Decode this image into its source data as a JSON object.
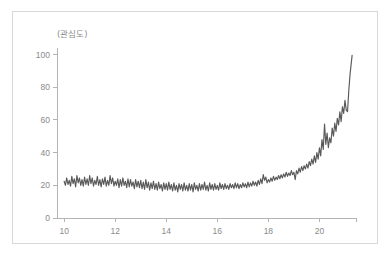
{
  "chart_data": {
    "type": "line",
    "title": "",
    "subtitle": "",
    "xlabel": "",
    "ylabel": "(관심도)",
    "ylabel_position": "top-left-above-axis",
    "xlim": [
      9.72,
      21.55
    ],
    "ylim": [
      0,
      104
    ],
    "grid": false,
    "legend": null,
    "annotations": [],
    "axis": {
      "y_ticks": [
        0,
        20,
        40,
        60,
        80,
        100
      ],
      "y_tick_labels": [
        "0",
        "20",
        "40",
        "60",
        "80",
        "100"
      ],
      "x_ticks": [
        10,
        12,
        14,
        16,
        18,
        20
      ],
      "x_tick_labels": [
        "10",
        "12",
        "14",
        "16",
        "18",
        "20"
      ],
      "x_axis_end_tick": 21.45
    },
    "series": [
      {
        "name": "관심도",
        "color": "#595959",
        "x": [
          10.0,
          10.05,
          10.1,
          10.15,
          10.2,
          10.25,
          10.3,
          10.35,
          10.4,
          10.45,
          10.5,
          10.55,
          10.6,
          10.65,
          10.7,
          10.75,
          10.8,
          10.85,
          10.9,
          10.95,
          11.0,
          11.05,
          11.1,
          11.15,
          11.2,
          11.25,
          11.3,
          11.35,
          11.4,
          11.45,
          11.5,
          11.55,
          11.6,
          11.65,
          11.7,
          11.75,
          11.8,
          11.85,
          11.9,
          11.95,
          12.0,
          12.05,
          12.1,
          12.15,
          12.2,
          12.25,
          12.3,
          12.35,
          12.4,
          12.45,
          12.5,
          12.55,
          12.6,
          12.65,
          12.7,
          12.75,
          12.8,
          12.85,
          12.9,
          12.95,
          13.0,
          13.05,
          13.1,
          13.15,
          13.2,
          13.25,
          13.3,
          13.35,
          13.4,
          13.45,
          13.5,
          13.55,
          13.6,
          13.65,
          13.7,
          13.75,
          13.8,
          13.85,
          13.9,
          13.95,
          14.0,
          14.05,
          14.1,
          14.15,
          14.2,
          14.25,
          14.3,
          14.35,
          14.4,
          14.45,
          14.5,
          14.55,
          14.6,
          14.65,
          14.7,
          14.75,
          14.8,
          14.85,
          14.9,
          14.95,
          15.0,
          15.05,
          15.1,
          15.15,
          15.2,
          15.25,
          15.3,
          15.35,
          15.4,
          15.45,
          15.5,
          15.55,
          15.6,
          15.65,
          15.7,
          15.75,
          15.8,
          15.85,
          15.9,
          15.95,
          16.0,
          16.05,
          16.1,
          16.15,
          16.2,
          16.25,
          16.3,
          16.35,
          16.4,
          16.45,
          16.5,
          16.55,
          16.6,
          16.65,
          16.7,
          16.75,
          16.8,
          16.85,
          16.9,
          16.95,
          17.0,
          17.05,
          17.1,
          17.15,
          17.2,
          17.25,
          17.3,
          17.35,
          17.4,
          17.45,
          17.5,
          17.55,
          17.6,
          17.65,
          17.7,
          17.75,
          17.8,
          17.85,
          17.9,
          17.95,
          18.0,
          18.05,
          18.1,
          18.15,
          18.2,
          18.25,
          18.3,
          18.35,
          18.4,
          18.45,
          18.5,
          18.55,
          18.6,
          18.65,
          18.7,
          18.75,
          18.8,
          18.85,
          18.9,
          18.95,
          19.0,
          19.05,
          19.1,
          19.15,
          19.2,
          19.25,
          19.3,
          19.35,
          19.4,
          19.45,
          19.5,
          19.55,
          19.6,
          19.65,
          19.7,
          19.75,
          19.8,
          19.85,
          19.9,
          19.95,
          20.0,
          20.05,
          20.1,
          20.15,
          20.2,
          20.25,
          20.3,
          20.35,
          20.4,
          20.45,
          20.5,
          20.55,
          20.6,
          20.65,
          20.7,
          20.75,
          20.8,
          20.85,
          20.9,
          20.95,
          21.0,
          21.05,
          21.1,
          21.15,
          21.2,
          21.28
        ],
        "y": [
          22.5,
          20.0,
          24.5,
          20.5,
          23.0,
          19.5,
          25.5,
          21.0,
          24.0,
          19.0,
          26.0,
          21.5,
          24.5,
          20.0,
          23.5,
          19.5,
          25.0,
          20.5,
          24.0,
          20.0,
          26.0,
          21.0,
          24.5,
          19.5,
          23.0,
          20.5,
          25.5,
          20.0,
          23.5,
          19.0,
          24.0,
          20.5,
          25.0,
          19.5,
          23.0,
          20.0,
          26.0,
          21.0,
          24.5,
          19.5,
          22.5,
          20.0,
          24.0,
          18.5,
          23.5,
          19.5,
          24.5,
          20.0,
          22.5,
          18.5,
          24.0,
          19.0,
          23.5,
          19.5,
          22.0,
          18.0,
          23.5,
          19.0,
          22.5,
          18.5,
          23.0,
          18.0,
          22.0,
          17.5,
          23.5,
          18.5,
          22.0,
          17.0,
          21.5,
          18.0,
          22.5,
          17.5,
          21.0,
          17.0,
          22.0,
          18.0,
          20.5,
          16.5,
          21.5,
          17.5,
          21.0,
          17.0,
          22.0,
          17.5,
          20.5,
          16.5,
          21.5,
          17.0,
          20.0,
          16.0,
          21.0,
          17.5,
          20.5,
          16.5,
          21.5,
          17.0,
          20.0,
          16.5,
          21.0,
          17.0,
          20.5,
          16.0,
          21.5,
          17.5,
          20.0,
          16.5,
          21.0,
          17.0,
          20.5,
          17.5,
          22.0,
          17.0,
          20.0,
          16.5,
          21.5,
          17.5,
          20.5,
          17.0,
          21.0,
          17.5,
          20.0,
          17.0,
          21.5,
          18.0,
          20.5,
          17.5,
          21.0,
          18.0,
          20.0,
          17.5,
          21.0,
          18.5,
          20.5,
          18.0,
          21.5,
          18.5,
          21.0,
          18.0,
          20.5,
          18.5,
          21.5,
          19.0,
          21.0,
          18.5,
          22.0,
          19.0,
          21.5,
          19.5,
          22.5,
          20.0,
          22.0,
          19.5,
          23.0,
          20.5,
          24.0,
          21.0,
          26.5,
          23.0,
          25.0,
          21.5,
          23.5,
          22.0,
          24.5,
          22.5,
          25.5,
          23.0,
          25.0,
          23.5,
          26.0,
          24.0,
          26.5,
          24.5,
          27.0,
          25.0,
          28.0,
          25.5,
          27.5,
          26.0,
          29.0,
          26.5,
          28.0,
          23.5,
          29.0,
          27.0,
          30.5,
          28.0,
          31.5,
          29.0,
          32.0,
          30.0,
          33.0,
          30.5,
          34.5,
          32.0,
          36.0,
          33.0,
          38.0,
          34.0,
          40.0,
          36.0,
          43.0,
          38.0,
          48.0,
          42.0,
          57.5,
          45.0,
          52.0,
          43.0,
          49.0,
          46.0,
          55.0,
          50.0,
          58.0,
          53.0,
          61.0,
          57.0,
          65.0,
          59.0,
          68.0,
          64.0,
          72.0,
          66.0,
          65.0,
          78.0,
          88.0,
          99.5
        ]
      }
    ]
  },
  "figure": {
    "background_color": "#ffffff",
    "card_border_color": "#d8d8d8",
    "axis_color": "#b4b4b4",
    "tick_label_color": "#8a8a8a",
    "line_color": "#595959"
  }
}
